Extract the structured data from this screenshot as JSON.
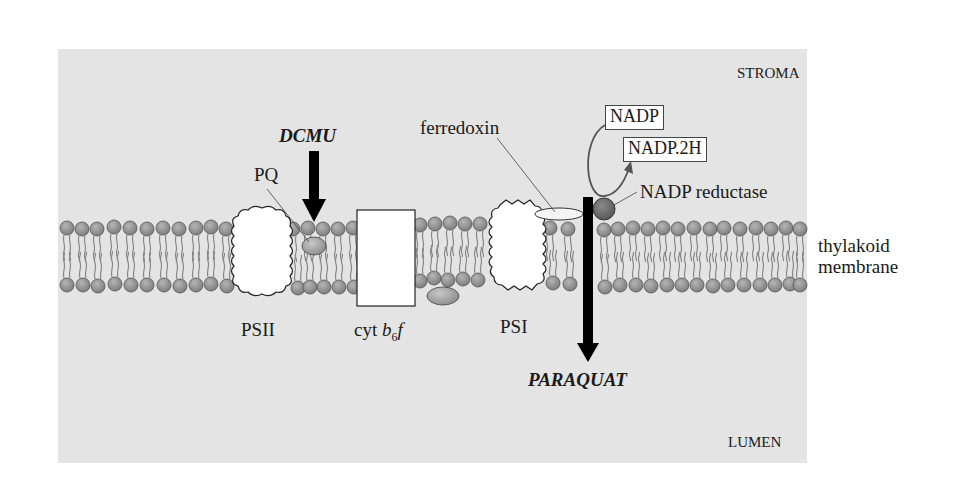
{
  "figure": {
    "regions": {
      "stroma": "STROMA",
      "lumen": "LUMEN"
    },
    "membrane_label": {
      "line1": "thylakoid",
      "line2": "membrane"
    },
    "complexes": {
      "psii": "PSII",
      "cyt_prefix": "cyt ",
      "cyt_b": "b",
      "cyt_sub": "6",
      "cyt_f": "f",
      "psi": "PSI"
    },
    "carriers": {
      "pq": "PQ",
      "ferredoxin": "ferredoxin",
      "nadp_reductase": "NADP reductase"
    },
    "substrates": {
      "nadp": "NADP",
      "nadph": "NADP.2H"
    },
    "herbicides": {
      "dcmu": "DCMU",
      "paraquat": "PARAQUAT"
    },
    "colors": {
      "background_panel": "#e4e4e4",
      "lipid_head": "#8a8a8a",
      "reductase": "#6a6a6a",
      "arrow": "#000000",
      "complex_fill": "#ffffff"
    }
  }
}
